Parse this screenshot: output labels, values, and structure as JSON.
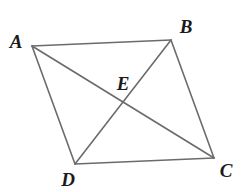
{
  "figure": {
    "kind": "geometry-diagram",
    "canvas": {
      "width": 245,
      "height": 192,
      "background": "#ffffff"
    },
    "style": {
      "stroke_color": "#6b6b6b",
      "stroke_width": 1.6,
      "label_color": "#1a1a1a",
      "label_font_size": 19
    },
    "points": [
      {
        "id": "A",
        "label": "A",
        "x": 32,
        "y": 46,
        "label_x": 16,
        "label_y": 41
      },
      {
        "id": "B",
        "label": "B",
        "x": 171,
        "y": 40,
        "label_x": 186,
        "label_y": 26
      },
      {
        "id": "C",
        "label": "C",
        "x": 214,
        "y": 158,
        "label_x": 226,
        "label_y": 170
      },
      {
        "id": "D",
        "label": "D",
        "x": 75,
        "y": 164,
        "label_x": 68,
        "label_y": 179
      },
      {
        "id": "E",
        "label": "E",
        "x": 123,
        "y": 102,
        "label_x": 123,
        "label_y": 83
      }
    ],
    "segments": [
      {
        "id": "AB",
        "from": "A",
        "to": "B",
        "role": "side"
      },
      {
        "id": "BC",
        "from": "B",
        "to": "C",
        "role": "side"
      },
      {
        "id": "CD",
        "from": "C",
        "to": "D",
        "role": "side"
      },
      {
        "id": "DA",
        "from": "D",
        "to": "A",
        "role": "side"
      },
      {
        "id": "AC",
        "from": "A",
        "to": "C",
        "role": "diagonal"
      },
      {
        "id": "BD",
        "from": "B",
        "to": "D",
        "role": "diagonal"
      }
    ],
    "labels": {
      "A": "A",
      "B": "B",
      "C": "C",
      "D": "D",
      "E": "E"
    }
  }
}
